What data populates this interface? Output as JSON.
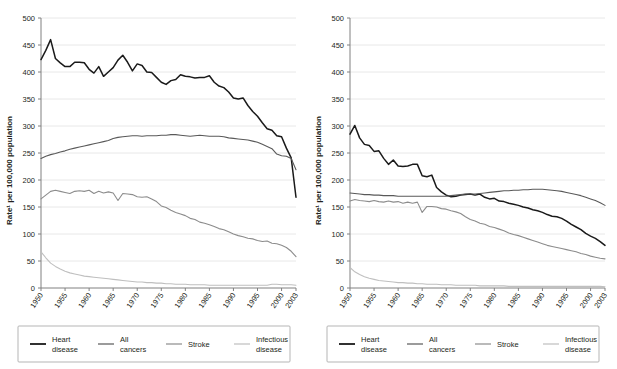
{
  "figure": {
    "panels": [
      "left",
      "right"
    ],
    "axis_title_y": "Rate¹ per 100,000 population",
    "y_ticks": [
      0,
      50,
      100,
      150,
      200,
      250,
      300,
      350,
      400,
      450,
      500
    ],
    "x_ticks": [
      "1950",
      "1955",
      "1960",
      "1965",
      "1970",
      "1975",
      "1980",
      "1985",
      "1990",
      "1995",
      "2000",
      "2003"
    ],
    "colors": {
      "heart_disease": "#1a1a1a",
      "all_cancers": "#595959",
      "stroke": "#8c8c8c",
      "infectious_disease": "#bfbfbf",
      "grid": "#e8e8e8",
      "axis": "#808080",
      "legend_border": "#b5b5b5",
      "text": "#231f20"
    },
    "legend": {
      "items": [
        {
          "label_line1": "Heart",
          "label_line2": "disease",
          "key": "heart_disease"
        },
        {
          "label_line1": "All",
          "label_line2": "cancers",
          "key": "all_cancers"
        },
        {
          "label_line1": "Stroke",
          "label_line2": "",
          "key": "stroke"
        },
        {
          "label_line1": "Infectious",
          "label_line2": "disease",
          "key": "infectious_disease"
        }
      ]
    }
  },
  "chart_data": [
    {
      "type": "line",
      "panel": "left",
      "title": "",
      "xlabel": "",
      "ylabel": "Rate¹ per 100,000 population",
      "xlim": [
        1950,
        2003
      ],
      "ylim": [
        0,
        500
      ],
      "grid": true,
      "legend_position": "bottom",
      "x": [
        1950,
        1951,
        1952,
        1953,
        1954,
        1955,
        1956,
        1957,
        1958,
        1959,
        1960,
        1961,
        1962,
        1963,
        1964,
        1965,
        1966,
        1967,
        1968,
        1969,
        1970,
        1971,
        1972,
        1973,
        1974,
        1975,
        1976,
        1977,
        1978,
        1979,
        1980,
        1981,
        1982,
        1983,
        1984,
        1985,
        1986,
        1987,
        1988,
        1989,
        1990,
        1991,
        1992,
        1993,
        1994,
        1995,
        1996,
        1997,
        1998,
        1999,
        2000,
        2001,
        2002,
        2003
      ],
      "series": [
        {
          "name": "Heart disease",
          "color": "#1a1a1a",
          "values": [
            423,
            440,
            460,
            425,
            417,
            410,
            410,
            418,
            418,
            417,
            405,
            398,
            410,
            392,
            400,
            408,
            422,
            431,
            418,
            402,
            415,
            412,
            400,
            399,
            390,
            381,
            377,
            384,
            386,
            395,
            392,
            391,
            389,
            390,
            390,
            393,
            381,
            374,
            371,
            363,
            352,
            350,
            352,
            338,
            327,
            318,
            306,
            295,
            292,
            282,
            280,
            259,
            241,
            168
          ]
        },
        {
          "name": "All cancers",
          "color": "#595959",
          "values": [
            240,
            244,
            247,
            249,
            252,
            254,
            257,
            259,
            261,
            263,
            265,
            267,
            269,
            271,
            273,
            277,
            279,
            280,
            281,
            282,
            282,
            281,
            282,
            282,
            282,
            283,
            283,
            284,
            284,
            283,
            282,
            281,
            282,
            283,
            282,
            281,
            281,
            281,
            280,
            278,
            277,
            276,
            275,
            274,
            272,
            270,
            266,
            262,
            258,
            248,
            245,
            244,
            240,
            219
          ]
        },
        {
          "name": "Stroke",
          "color": "#8c8c8c",
          "values": [
            165,
            172,
            179,
            181,
            179,
            177,
            175,
            179,
            180,
            179,
            181,
            175,
            179,
            176,
            178,
            176,
            162,
            175,
            174,
            173,
            169,
            168,
            169,
            165,
            160,
            152,
            149,
            144,
            140,
            137,
            134,
            129,
            127,
            122,
            120,
            117,
            114,
            110,
            108,
            104,
            100,
            97,
            95,
            92,
            91,
            88,
            86,
            87,
            83,
            82,
            79,
            75,
            68,
            58
          ]
        },
        {
          "name": "Infectious disease",
          "color": "#bfbfbf",
          "values": [
            67,
            56,
            46,
            40,
            35,
            31,
            28,
            26,
            24,
            22,
            21,
            20,
            19,
            18,
            17,
            16,
            15,
            14,
            13,
            12,
            11,
            11,
            10,
            10,
            9,
            9,
            8,
            8,
            7,
            7,
            7,
            6,
            6,
            6,
            6,
            5,
            5,
            5,
            5,
            5,
            5,
            5,
            5,
            5,
            5,
            5,
            5,
            5,
            7,
            7,
            6,
            6,
            6,
            5
          ]
        }
      ]
    },
    {
      "type": "line",
      "panel": "right",
      "title": "",
      "xlabel": "",
      "ylabel": "Rate¹ per 100,000 population",
      "xlim": [
        1950,
        2003
      ],
      "ylim": [
        0,
        500
      ],
      "grid": true,
      "legend_position": "bottom",
      "x": [
        1950,
        1951,
        1952,
        1953,
        1954,
        1955,
        1956,
        1957,
        1958,
        1959,
        1960,
        1961,
        1962,
        1963,
        1964,
        1965,
        1966,
        1967,
        1968,
        1969,
        1970,
        1971,
        1972,
        1973,
        1974,
        1975,
        1976,
        1977,
        1978,
        1979,
        1980,
        1981,
        1982,
        1983,
        1984,
        1985,
        1986,
        1987,
        1988,
        1989,
        1990,
        1991,
        1992,
        1993,
        1994,
        1995,
        1996,
        1997,
        1998,
        1999,
        2000,
        2001,
        2002,
        2003
      ],
      "series": [
        {
          "name": "Heart disease",
          "color": "#1a1a1a",
          "values": [
            285,
            301,
            278,
            266,
            264,
            253,
            254,
            240,
            229,
            237,
            226,
            225,
            226,
            229,
            229,
            208,
            206,
            209,
            186,
            178,
            172,
            169,
            170,
            172,
            173,
            174,
            172,
            174,
            168,
            165,
            166,
            161,
            160,
            157,
            155,
            153,
            150,
            148,
            145,
            143,
            140,
            136,
            133,
            132,
            129,
            124,
            118,
            113,
            108,
            101,
            96,
            92,
            86,
            79
          ]
        },
        {
          "name": "All cancers",
          "color": "#595959",
          "values": [
            176,
            175,
            174,
            173,
            173,
            172,
            172,
            171,
            171,
            171,
            170,
            170,
            170,
            170,
            170,
            170,
            170,
            170,
            170,
            170,
            170,
            171,
            172,
            173,
            174,
            174,
            174,
            175,
            176,
            177,
            178,
            179,
            180,
            180,
            181,
            181,
            182,
            182,
            183,
            183,
            183,
            182,
            181,
            180,
            179,
            177,
            175,
            173,
            171,
            168,
            165,
            162,
            158,
            153
          ]
        },
        {
          "name": "Stroke",
          "color": "#8c8c8c",
          "values": [
            161,
            164,
            162,
            161,
            160,
            162,
            160,
            159,
            161,
            159,
            160,
            157,
            159,
            157,
            159,
            140,
            151,
            151,
            150,
            147,
            146,
            143,
            141,
            138,
            132,
            127,
            124,
            120,
            118,
            114,
            112,
            109,
            106,
            102,
            99,
            97,
            94,
            91,
            88,
            85,
            82,
            79,
            77,
            75,
            73,
            71,
            69,
            67,
            64,
            62,
            59,
            57,
            55,
            54
          ]
        },
        {
          "name": "Infectious disease",
          "color": "#bfbfbf",
          "values": [
            38,
            30,
            25,
            21,
            18,
            16,
            14,
            13,
            12,
            11,
            10,
            10,
            9,
            9,
            8,
            8,
            7,
            7,
            7,
            6,
            6,
            6,
            5,
            5,
            5,
            5,
            5,
            4,
            4,
            4,
            4,
            4,
            4,
            3,
            3,
            3,
            3,
            3,
            3,
            3,
            3,
            3,
            3,
            3,
            3,
            3,
            3,
            3,
            3,
            3,
            3,
            3,
            3,
            2
          ]
        }
      ]
    }
  ]
}
